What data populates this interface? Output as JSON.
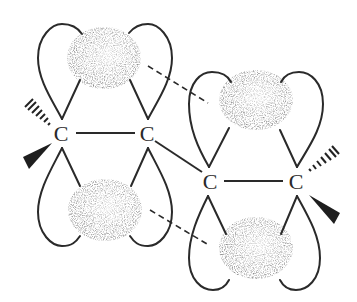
{
  "diagram": {
    "type": "molecular-orbital-diagram",
    "atoms": [
      {
        "id": "C1",
        "label": "C",
        "x": 61,
        "y": 133
      },
      {
        "id": "C2",
        "label": "C",
        "x": 147,
        "y": 133
      },
      {
        "id": "C3",
        "label": "C",
        "x": 210,
        "y": 181
      },
      {
        "id": "C4",
        "label": "C",
        "x": 296,
        "y": 181
      }
    ],
    "bonds": [
      {
        "from": "C1",
        "to": "C2",
        "style": "solid"
      },
      {
        "from": "C2",
        "to": "C3",
        "style": "solid"
      },
      {
        "from": "C3",
        "to": "C4",
        "style": "solid"
      }
    ],
    "substituents": [
      {
        "atom": "C1",
        "style": "hashed-wedge",
        "direction": "upper-left"
      },
      {
        "atom": "C1",
        "style": "solid-wedge",
        "direction": "lower-left"
      },
      {
        "atom": "C4",
        "style": "hashed-wedge",
        "direction": "upper-right"
      },
      {
        "atom": "C4",
        "style": "solid-wedge",
        "direction": "lower-right"
      }
    ],
    "orbital_clouds": [
      {
        "id": "cloud-top-left",
        "cx": 104,
        "cy": 58
      },
      {
        "id": "cloud-bottom-left",
        "cx": 105,
        "cy": 210
      },
      {
        "id": "cloud-top-right",
        "cx": 256,
        "cy": 100
      },
      {
        "id": "cloud-bottom-right",
        "cx": 256,
        "cy": 248
      }
    ],
    "overlap_lines": [
      {
        "from": "cloud-top-left",
        "to": "cloud-top-right",
        "style": "dashed"
      },
      {
        "from": "cloud-bottom-left",
        "to": "cloud-bottom-right",
        "style": "dashed"
      }
    ],
    "colors": {
      "line": "#2a2a2a",
      "cloud": "#555555",
      "background": "#ffffff"
    }
  }
}
